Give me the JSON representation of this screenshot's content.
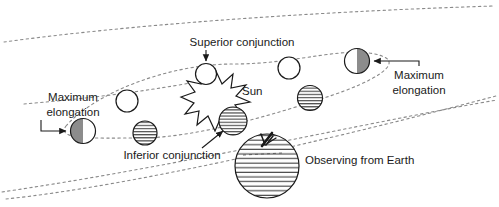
{
  "diagram": {
    "background_color": "#ffffff",
    "ink_color": "#1a1a1a",
    "orbit_color": "#8a8a8a",
    "shaded_color": "#8c8c8c",
    "width": 499,
    "height": 207
  },
  "labels": {
    "superior_conjunction": "Superior conjunction",
    "inferior_conjunction": "Inferior conjunction",
    "sun": "Sun",
    "maximum_elongation_left_line1": "Maximum",
    "maximum_elongation_left_line2": "elongation",
    "maximum_elongation_right_line1": "Maximum",
    "maximum_elongation_right_line2": "elongation",
    "observing_from_earth": "Observing from Earth"
  },
  "bodies": [
    {
      "name": "planet-superior-conjunction",
      "phase": "new-white",
      "cx": 206,
      "cy": 74,
      "r": 10.5,
      "label": "Superior conjunction"
    },
    {
      "name": "planet-max-elongation-left",
      "phase": "half-dark-left",
      "cx": 83,
      "cy": 131,
      "r": 12.5,
      "label": "Maximum elongation"
    },
    {
      "name": "planet-max-elongation-right",
      "phase": "half-dark-right",
      "cx": 357,
      "cy": 61,
      "r": 12.5,
      "label": "Maximum elongation"
    },
    {
      "name": "planet-upper-left",
      "phase": "new-white",
      "cx": 127,
      "cy": 101,
      "r": 11.0,
      "label": ""
    },
    {
      "name": "planet-upper-right",
      "phase": "new-white",
      "cx": 289,
      "cy": 68,
      "r": 11.0,
      "label": ""
    },
    {
      "name": "planet-lower-left",
      "phase": "full-hatched",
      "cx": 145,
      "cy": 133,
      "r": 12.0,
      "label": ""
    },
    {
      "name": "planet-lower-right",
      "phase": "full-hatched",
      "cx": 310,
      "cy": 98,
      "r": 12.5,
      "label": ""
    },
    {
      "name": "planet-inferior-conjunction",
      "phase": "full-hatched",
      "cx": 233,
      "cy": 121,
      "r": 14.0,
      "label": "Inferior conjunction"
    },
    {
      "name": "earth",
      "phase": "full-hatched",
      "cx": 267,
      "cy": 166,
      "r": 32.0,
      "label": "Observing from Earth"
    }
  ],
  "sun": {
    "name": "sun-starburst",
    "cx": 215,
    "cy": 96,
    "radius_outer": 27,
    "radius_inner": 14,
    "points": 11,
    "label": "Sun"
  },
  "orbits": [
    {
      "name": "outer-ecliptic-upper",
      "role": "outer dashed guide line, upper"
    },
    {
      "name": "outer-ecliptic-lower",
      "role": "outer dashed guide line, lower"
    },
    {
      "name": "planet-orbit-ellipse",
      "role": "inferior planet orbit around the Sun"
    },
    {
      "name": "earth-orbit-arc",
      "role": "Earth orbit arc"
    }
  ]
}
